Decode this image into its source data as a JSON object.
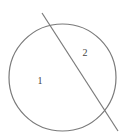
{
  "diagram": {
    "type": "circle-divided-by-line",
    "colors": {
      "stroke": "#7a7a7a",
      "label": "#444444",
      "background": "#ffffff"
    },
    "circle": {
      "cx": 62.5,
      "cy": 77.5,
      "r": 53.5
    },
    "line": {
      "x1": 42,
      "y1": 13,
      "x2": 118,
      "y2": 131
    },
    "regions": [
      {
        "id": "region-1",
        "label": "1",
        "x": 40,
        "y": 84
      },
      {
        "id": "region-2",
        "label": "2",
        "x": 85,
        "y": 56
      }
    ]
  }
}
